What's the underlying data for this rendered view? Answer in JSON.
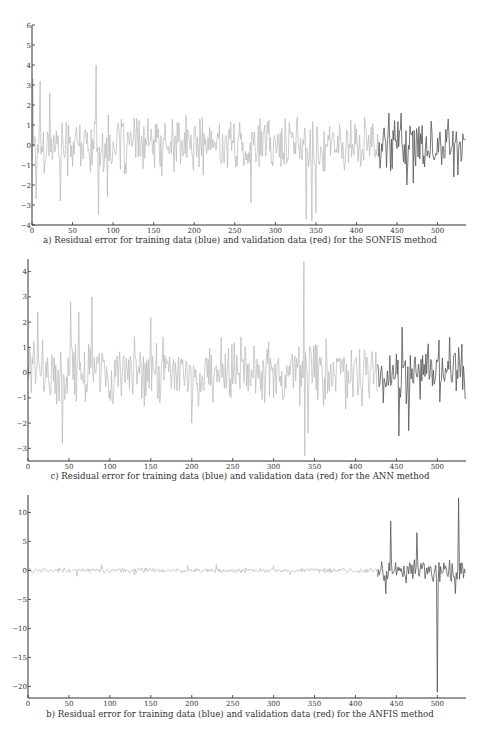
{
  "header": {
    "text": ""
  },
  "chart_data": [
    {
      "type": "line",
      "id": "sonfis",
      "title": "",
      "caption": "a) Residual error for training data (blue) and validation data (red) for the SONFIS method",
      "xlabel": "",
      "ylabel": "",
      "xlim": [
        0,
        535
      ],
      "ylim": [
        -4,
        6
      ],
      "xticks": [
        0,
        50,
        100,
        150,
        200,
        250,
        300,
        350,
        400,
        450,
        500
      ],
      "yticks": [
        -4,
        -3,
        -2,
        -1,
        0,
        1,
        2,
        3,
        4,
        5,
        6
      ],
      "grid": false,
      "legend": "none (described in caption)",
      "split_index": 428,
      "series": [
        {
          "name": "Training data",
          "color": "#b8b8b8",
          "range": [
            0,
            428
          ],
          "amplitude": 1.1,
          "spikes": [
            [
              1,
              3.3
            ],
            [
              5,
              -2.7
            ],
            [
              10,
              3.2
            ],
            [
              22,
              2.6
            ],
            [
              35,
              -2.8
            ],
            [
              79,
              4.0
            ],
            [
              82,
              -3.5
            ],
            [
              93,
              -2.6
            ],
            [
              270,
              -2.9
            ],
            [
              338,
              -3.7
            ],
            [
              345,
              -3.8
            ],
            [
              350,
              -3.4
            ]
          ]
        },
        {
          "name": "Validation data",
          "color": "#555555",
          "range": [
            428,
            535
          ],
          "amplitude": 0.9,
          "spikes": [
            [
              440,
              1.6
            ],
            [
              455,
              1.6
            ],
            [
              462,
              -2.0
            ],
            [
              470,
              -1.9
            ],
            [
              513,
              1.3
            ],
            [
              520,
              -1.6
            ],
            [
              525,
              -1.5
            ]
          ]
        }
      ]
    },
    {
      "type": "line",
      "id": "ann",
      "title": "",
      "caption": "c) Residual error for training data (blue) and validation data (red) for the ANN method",
      "xlabel": "",
      "ylabel": "",
      "xlim": [
        0,
        535
      ],
      "ylim": [
        -3.5,
        4.5
      ],
      "xticks": [
        0,
        50,
        100,
        150,
        200,
        250,
        300,
        350,
        400,
        450,
        500
      ],
      "yticks": [
        -3,
        -2,
        -1,
        0,
        1,
        2,
        3,
        4
      ],
      "grid": false,
      "legend": "none (described in caption)",
      "split_index": 428,
      "series": [
        {
          "name": "Training data",
          "color": "#b8b8b8",
          "range": [
            0,
            428
          ],
          "amplitude": 1.0,
          "spikes": [
            [
              12,
              2.4
            ],
            [
              42,
              -2.8
            ],
            [
              52,
              2.8
            ],
            [
              62,
              2.4
            ],
            [
              78,
              3.0
            ],
            [
              150,
              2.2
            ],
            [
              200,
              -2.0
            ],
            [
              337,
              4.4
            ],
            [
              338,
              -3.3
            ],
            [
              342,
              -2.4
            ]
          ]
        },
        {
          "name": "Validation data",
          "color": "#555555",
          "range": [
            428,
            535
          ],
          "amplitude": 0.9,
          "spikes": [
            [
              457,
              1.8
            ],
            [
              453,
              -2.5
            ],
            [
              465,
              -2.3
            ],
            [
              515,
              1.4
            ]
          ]
        }
      ]
    },
    {
      "type": "line",
      "id": "anfis",
      "title": "",
      "caption": "b) Residual error for training data (blue) and validation data (red) for the ANFIS method",
      "xlabel": "",
      "ylabel": "",
      "xlim": [
        0,
        535
      ],
      "ylim": [
        -22,
        13
      ],
      "xticks": [
        0,
        50,
        100,
        150,
        200,
        250,
        300,
        350,
        400,
        450,
        500
      ],
      "yticks": [
        -20,
        -15,
        -10,
        -5,
        0,
        5,
        10
      ],
      "grid": false,
      "legend": "none (described in caption)",
      "split_index": 428,
      "series": [
        {
          "name": "Training data",
          "color": "#b8b8b8",
          "range": [
            0,
            428
          ],
          "amplitude": 0.35,
          "spikes": [
            [
              60,
              -1.0
            ],
            [
              90,
              1.0
            ],
            [
              130,
              -0.8
            ],
            [
              195,
              0.9
            ],
            [
              230,
              1.0
            ],
            [
              300,
              0.8
            ],
            [
              320,
              -0.7
            ]
          ]
        },
        {
          "name": "Validation data",
          "color": "#555555",
          "range": [
            428,
            535
          ],
          "amplitude": 1.5,
          "spikes": [
            [
              443,
              8.5
            ],
            [
              437,
              -4.0
            ],
            [
              475,
              6.5
            ],
            [
              500,
              -21.0
            ],
            [
              522,
              -4.0
            ],
            [
              526,
              12.5
            ]
          ]
        }
      ]
    }
  ]
}
